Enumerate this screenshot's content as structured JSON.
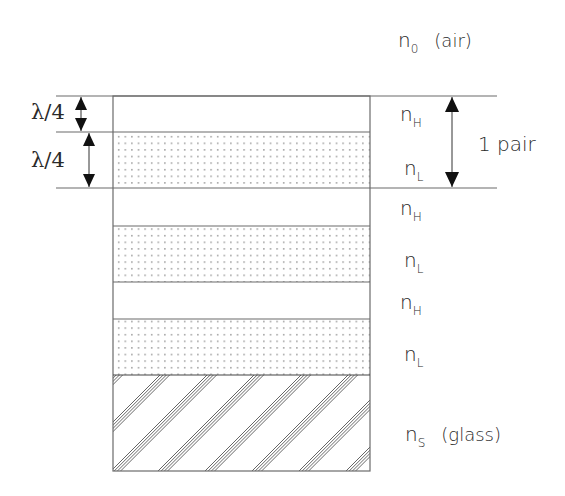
{
  "diagram": {
    "ambient": {
      "symbol": "n",
      "subscript": "0",
      "medium": "(air)"
    },
    "substrate": {
      "symbol": "n",
      "subscript": "S",
      "medium": "(glass)"
    },
    "layers": [
      {
        "symbol": "n",
        "subscript": "H",
        "fill": "clear"
      },
      {
        "symbol": "n",
        "subscript": "L",
        "fill": "dotted"
      },
      {
        "symbol": "n",
        "subscript": "H",
        "fill": "clear"
      },
      {
        "symbol": "n",
        "subscript": "L",
        "fill": "dotted"
      },
      {
        "symbol": "n",
        "subscript": "H",
        "fill": "clear"
      },
      {
        "symbol": "n",
        "subscript": "L",
        "fill": "dotted"
      }
    ],
    "thickness_labels": [
      {
        "text": "λ/4",
        "layer": "first nH"
      },
      {
        "text": "λ/4",
        "layer": "first nL"
      }
    ],
    "pair_label": "1 pair",
    "colors": {
      "line": "#6b6b6b",
      "dot": "#8a8a8a",
      "hatch": "#555555",
      "text": "#2a2a2a"
    }
  }
}
